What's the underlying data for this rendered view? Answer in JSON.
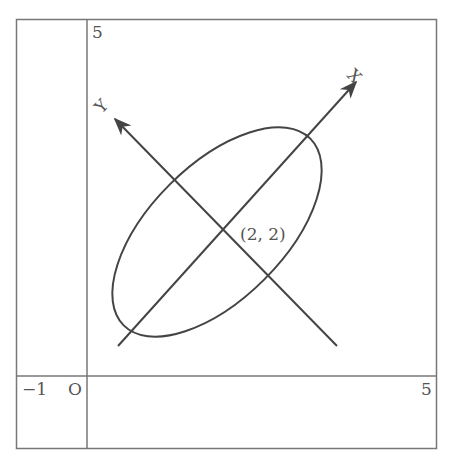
{
  "diagram": {
    "axes": {
      "y_tick_top": "5",
      "x_tick_right": "5",
      "x_tick_neg": "−1",
      "origin": "O"
    },
    "rotated_axes": {
      "x_label": "X",
      "y_label": "Y"
    },
    "center_label": "(2, 2)",
    "colors": {
      "frame": "#777777",
      "curve": "#444444",
      "text": "#555555"
    }
  }
}
